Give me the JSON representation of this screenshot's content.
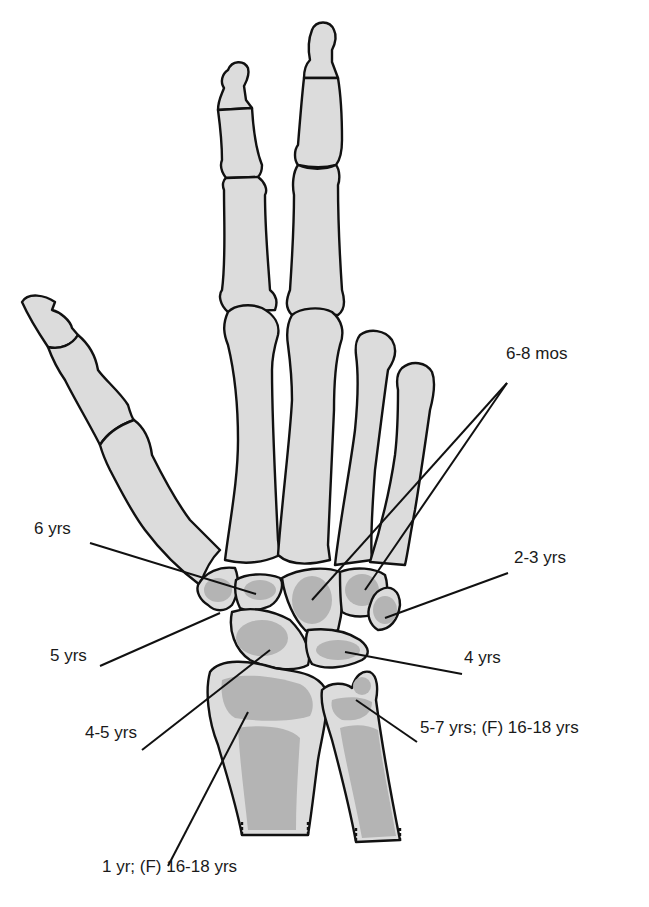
{
  "figure": {
    "labels": [
      {
        "id": "capitate-hamate",
        "text": "6-8 mos",
        "x": 506,
        "y": 362
      },
      {
        "id": "trapezoid",
        "text": "6 yrs",
        "x": 34,
        "y": 537
      },
      {
        "id": "triquetrum",
        "text": "2-3 yrs",
        "x": 514,
        "y": 566
      },
      {
        "id": "trapezium",
        "text": "5 yrs",
        "x": 50,
        "y": 664
      },
      {
        "id": "lunate",
        "text": "4 yrs",
        "x": 464,
        "y": 666
      },
      {
        "id": "scaphoid",
        "text": "4-5 yrs",
        "x": 85,
        "y": 741
      },
      {
        "id": "ulna-epiphysis",
        "text": "5-7 yrs; (F) 16-18 yrs",
        "x": 420,
        "y": 736
      },
      {
        "id": "radius-epiphysis",
        "text": "1 yr; (F) 16-18 yrs",
        "x": 102,
        "y": 875
      }
    ],
    "colors": {
      "bone_fill": "#dcdcdc",
      "ossification_fill": "#b4b4b4",
      "outline": "#111111",
      "background": "#ffffff"
    }
  }
}
